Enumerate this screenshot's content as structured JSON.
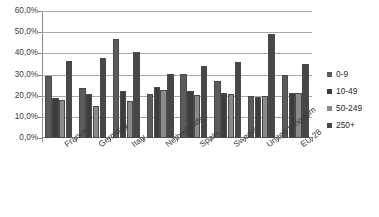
{
  "chart_data": {
    "type": "bar",
    "title": "",
    "subtitle": "",
    "xlabel": "",
    "ylabel": "",
    "ylim": [
      0,
      60
    ],
    "ytick_labels": [
      "60,0%",
      "50,0%",
      "40,0%",
      "30,0%",
      "20,0%",
      "10,0%",
      "0,0%"
    ],
    "ytick_values": [
      60,
      50,
      40,
      30,
      20,
      10,
      0
    ],
    "grid": true,
    "grid_axis": "y",
    "legend_position": "right",
    "categories": [
      "France",
      "Germany",
      "Italy",
      "Netherlands",
      "Spain",
      "Sweden",
      "United Kingdom",
      "EU-28"
    ],
    "series": [
      {
        "name": "0-9",
        "color": "#5b5b5b",
        "values": [
          29.5,
          23.5,
          47.0,
          20.8,
          30.2,
          27.0,
          20.0,
          30.0
        ]
      },
      {
        "name": "10-49",
        "color": "#3d3d3d",
        "values": [
          19.0,
          20.8,
          22.0,
          24.0,
          22.0,
          21.5,
          19.2,
          21.5
        ]
      },
      {
        "name": "50-249",
        "color": "#8a8a8a",
        "values": [
          18.0,
          15.0,
          17.5,
          22.5,
          20.5,
          21.0,
          20.0,
          21.5
        ]
      },
      {
        "name": "250+",
        "color": "#474747",
        "values": [
          36.5,
          37.8,
          40.5,
          30.2,
          34.0,
          36.0,
          49.2,
          35.0
        ]
      }
    ]
  },
  "legend": {
    "items": [
      {
        "label": "0-9"
      },
      {
        "label": "10-49"
      },
      {
        "label": "50-249"
      },
      {
        "label": "250+"
      }
    ]
  },
  "axes": {
    "y": {
      "labels": [
        "60,0%",
        "50,0%",
        "40,0%",
        "30,0%",
        "20,0%",
        "10,0%",
        "0,0%"
      ]
    },
    "x": {
      "labels": [
        "France",
        "Germany",
        "Italy",
        "Netherlands",
        "Spain",
        "Sweden",
        "United Kingdom",
        "EU-28"
      ]
    }
  }
}
